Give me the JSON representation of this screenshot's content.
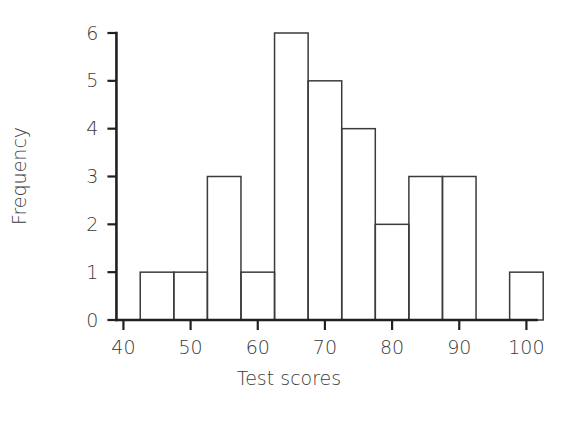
{
  "chart_data": {
    "type": "bar",
    "title": "",
    "subtitle": "",
    "xlabel": "Test scores",
    "ylabel": "Frequency",
    "xlim": [
      38,
      105
    ],
    "ylim": [
      0,
      6
    ],
    "grid": false,
    "legend": null,
    "bin_width": 5,
    "x_ticks": [
      40,
      50,
      60,
      70,
      80,
      90,
      100
    ],
    "x_tick_labels": [
      "40",
      "50",
      "60",
      "70",
      "80",
      "90",
      "100"
    ],
    "y_ticks": [
      0,
      1,
      2,
      3,
      4,
      5,
      6
    ],
    "y_tick_labels": [
      "0",
      "1",
      "2",
      "3",
      "4",
      "5",
      "6"
    ],
    "bins": [
      {
        "left": 42.5,
        "right": 47.5,
        "value": 1
      },
      {
        "left": 47.5,
        "right": 52.5,
        "value": 1
      },
      {
        "left": 52.5,
        "right": 57.5,
        "value": 3
      },
      {
        "left": 57.5,
        "right": 62.5,
        "value": 1
      },
      {
        "left": 62.5,
        "right": 67.5,
        "value": 6
      },
      {
        "left": 67.5,
        "right": 72.5,
        "value": 5
      },
      {
        "left": 72.5,
        "right": 77.5,
        "value": 4
      },
      {
        "left": 77.5,
        "right": 82.5,
        "value": 2
      },
      {
        "left": 82.5,
        "right": 87.5,
        "value": 3
      },
      {
        "left": 87.5,
        "right": 92.5,
        "value": 3
      },
      {
        "left": 97.5,
        "right": 102.5,
        "value": 1
      }
    ],
    "categories": [
      "42.5-47.5",
      "47.5-52.5",
      "52.5-57.5",
      "57.5-62.5",
      "62.5-67.5",
      "67.5-72.5",
      "72.5-77.5",
      "77.5-82.5",
      "82.5-87.5",
      "87.5-92.5",
      "97.5-102.5"
    ],
    "values": [
      1,
      1,
      3,
      1,
      6,
      5,
      4,
      2,
      3,
      3,
      1
    ],
    "colors": {
      "bar_stroke": "#3b3b3b",
      "bar_fill": "none",
      "axis": "#231f20",
      "text": "#3a3a3a",
      "background": "#ffffff"
    }
  }
}
